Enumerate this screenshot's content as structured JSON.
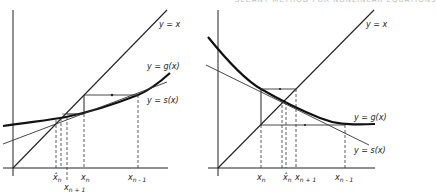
{
  "header": {
    "text": "SECANT METHOD FOR NONLINEAR EQUATIONS"
  },
  "panels": [
    {
      "id": "left",
      "curves": {
        "identity": "y = x",
        "g": "y = g(x)",
        "s": "y = s(x)"
      },
      "ticks": [
        {
          "base": "x",
          "hat": true,
          "sub": "n"
        },
        {
          "base": "x",
          "hat": false,
          "sub": "n + 1"
        },
        {
          "base": "x",
          "hat": false,
          "sub": "n"
        },
        {
          "base": "x",
          "hat": false,
          "sub": "n - 1"
        }
      ]
    },
    {
      "id": "right",
      "curves": {
        "identity": "y = x",
        "g": "y = g(x)",
        "s": "y = s(x)"
      },
      "ticks": [
        {
          "base": "x",
          "hat": false,
          "sub": "n"
        },
        {
          "base": "x",
          "hat": true,
          "sub": "n"
        },
        {
          "base": "x",
          "hat": false,
          "sub": "n + 1"
        },
        {
          "base": "x",
          "hat": false,
          "sub": "n - 1"
        }
      ]
    }
  ],
  "colors": {
    "ink": "#1a1a1a",
    "thin": "#333333"
  }
}
